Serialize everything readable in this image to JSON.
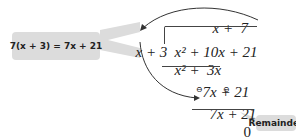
{
  "callout_left": {
    "text": "7(x + 3) = 7x + 21",
    "bg": "#dcdcdc"
  },
  "callout_right": {
    "text": "Remainder",
    "bg": "#dcdcdc"
  },
  "division": {
    "quotient": "x +  7",
    "divisor": "x + 3",
    "dividend": "x² + 10x + 21",
    "step1_subtract": "x² +  3x",
    "step1_result": "7x + 21",
    "step2_subtract": "7x + 21",
    "step2_signs": [
      "⊖",
      "⊖"
    ],
    "remainder": "0"
  }
}
